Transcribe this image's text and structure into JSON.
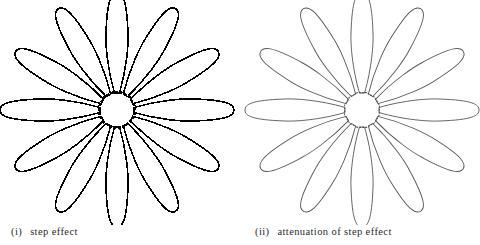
{
  "figure": {
    "panels": [
      {
        "id": "i",
        "label_num": "(i)",
        "label_text": "step effect",
        "center": [
          117,
          110
        ],
        "petal_count": 12,
        "inner_radius": 17,
        "petal_length": 100,
        "petal_half_width": 11,
        "stroke_color": "#000000",
        "stroke_width": 1.6
      },
      {
        "id": "ii",
        "label_num": "(ii)",
        "label_text": "attenuation of step effect",
        "center": [
          122,
          110
        ],
        "petal_count": 12,
        "inner_radius": 17,
        "petal_length": 100,
        "petal_half_width": 11,
        "stroke_color": "#555555",
        "stroke_width": 0.9
      }
    ]
  }
}
